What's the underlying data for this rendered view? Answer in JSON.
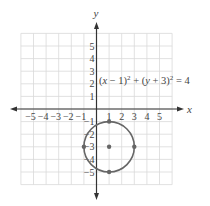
{
  "chart_data": {
    "type": "scatter",
    "title": "",
    "xlabel": "x",
    "ylabel": "y",
    "xlim": [
      -6,
      6
    ],
    "ylim": [
      -6,
      6
    ],
    "grid": true,
    "x_tick_labels": [
      "-5",
      "-4",
      "-3",
      "-2",
      "-1",
      "1",
      "2",
      "3",
      "4",
      "5"
    ],
    "y_tick_labels": [
      "5",
      "4",
      "3",
      "2",
      "1",
      "-1",
      "-2",
      "-3",
      "-4",
      "-5"
    ],
    "annotations": [
      {
        "text": "(x − 1)² + (y + 3)² = 4",
        "x": 0.2,
        "y": 2.5
      }
    ],
    "series": [
      {
        "name": "circle",
        "kind": "circle",
        "center": [
          1,
          -3
        ],
        "radius": 2
      },
      {
        "name": "marked points",
        "kind": "points",
        "points": [
          [
            1,
            -3
          ],
          [
            1,
            -1
          ],
          [
            -1,
            -3
          ],
          [
            3,
            -3
          ],
          [
            1,
            -5
          ]
        ]
      }
    ],
    "equation": "(x - 1)^2 + (y + 3)^2 = 4"
  },
  "colors": {
    "grid": "#d9d9d9",
    "axis": "#333333",
    "curve": "#666666",
    "text": "#444444"
  }
}
